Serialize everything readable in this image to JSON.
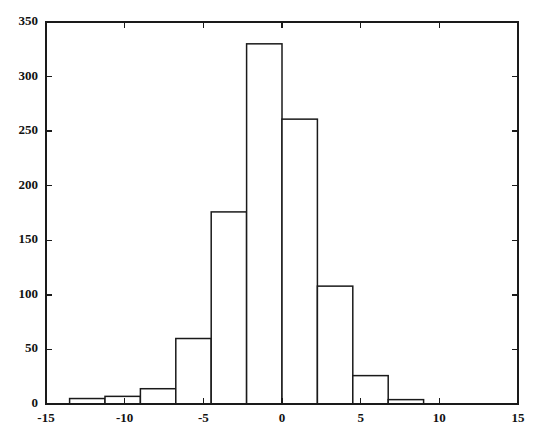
{
  "chart_data": {
    "type": "bar",
    "title": "",
    "subtitle": "",
    "xlabel": "",
    "ylabel": "",
    "xlim": [
      -15,
      15
    ],
    "ylim": [
      0,
      350
    ],
    "grid": false,
    "legend": null,
    "frame": true,
    "bar_style": {
      "fill": "#ffffff",
      "edge": "#1a1a1a",
      "edge_width": 1.5
    },
    "bin_width": 2.25,
    "x_ticks": [
      -15,
      -10,
      -5,
      0,
      5,
      10,
      15
    ],
    "x_tick_labels": [
      "-15",
      "-10",
      "-5",
      "0",
      "5",
      "10",
      "15"
    ],
    "y_ticks": [
      0,
      50,
      100,
      150,
      200,
      250,
      300,
      350
    ],
    "y_tick_labels": [
      "0",
      "50",
      "100",
      "150",
      "200",
      "250",
      "300",
      "350"
    ],
    "bin_edges": [
      -13.5,
      -11.25,
      -9.0,
      -6.75,
      -4.5,
      -2.25,
      0.0,
      2.25,
      4.5,
      6.75,
      9.0,
      11.25
    ],
    "bin_centers": [
      -12.375,
      -10.125,
      -7.875,
      -5.625,
      -3.375,
      -1.125,
      1.125,
      3.375,
      5.625,
      7.875,
      10.125
    ],
    "categories": [
      "-12.4",
      "-10.1",
      "-7.9",
      "-5.6",
      "-3.4",
      "-1.1",
      "1.1",
      "3.4",
      "5.6",
      "7.9",
      "10.1"
    ],
    "values": [
      5,
      7,
      14,
      60,
      176,
      330,
      261,
      108,
      26,
      4,
      0
    ]
  },
  "axes": {
    "x_axis_name": "x-axis",
    "y_axis_name": "y-axis"
  }
}
